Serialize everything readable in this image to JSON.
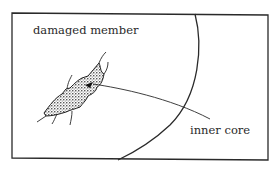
{
  "diagram": {
    "labels": {
      "damaged_member": "damaged member",
      "inner_core": "inner core"
    },
    "colors": {
      "stroke": "#2a2a2a",
      "background": "#ffffff"
    }
  }
}
